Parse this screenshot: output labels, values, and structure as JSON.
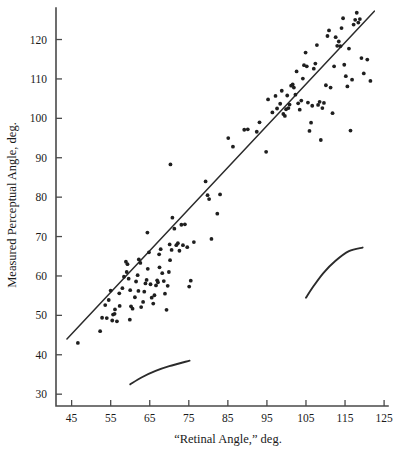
{
  "chart_data": {
    "type": "scatter",
    "title": "",
    "xlabel": "“Retinal Angle,” deg.",
    "ylabel": "Measured Perceptual Angle, deg.",
    "xlim": [
      41,
      126
    ],
    "ylim": [
      27,
      128
    ],
    "grid": false,
    "legend": "none",
    "point_color": "#1f1f1f",
    "line_color": "#2b2b2b",
    "xticks": [
      45,
      55,
      65,
      75,
      85,
      95,
      105,
      115,
      125
    ],
    "yticks": [
      30,
      40,
      50,
      60,
      70,
      80,
      90,
      100,
      110,
      120
    ],
    "xtick_labels": [
      "45",
      "55",
      "65",
      "75",
      "85",
      "95",
      "105",
      "115",
      "125"
    ],
    "ytick_labels": [
      "30",
      "40",
      "50",
      "60",
      "70",
      "80",
      "90",
      "100",
      "110",
      "120"
    ],
    "series": [
      {
        "name": "observations",
        "marker": "filled-circle",
        "points": [
          [
            46.6,
            43.0
          ],
          [
            52.3,
            46.0
          ],
          [
            52.8,
            49.4
          ],
          [
            54.0,
            49.3
          ],
          [
            53.6,
            52.6
          ],
          [
            54.5,
            53.9
          ],
          [
            55.0,
            56.3
          ],
          [
            55.6,
            50.2
          ],
          [
            56.0,
            50.4
          ],
          [
            56.1,
            51.5
          ],
          [
            55.4,
            48.7
          ],
          [
            56.6,
            48.5
          ],
          [
            57.3,
            52.4
          ],
          [
            57.2,
            55.6
          ],
          [
            58.0,
            56.9
          ],
          [
            58.4,
            59.8
          ],
          [
            58.9,
            63.6
          ],
          [
            59.3,
            63.0
          ],
          [
            59.1,
            61.0
          ],
          [
            59.6,
            59.3
          ],
          [
            60.0,
            56.4
          ],
          [
            60.2,
            52.3
          ],
          [
            59.9,
            48.9
          ],
          [
            60.6,
            51.7
          ],
          [
            61.2,
            54.6
          ],
          [
            61.5,
            58.6
          ],
          [
            61.9,
            60.2
          ],
          [
            62.2,
            64.2
          ],
          [
            62.6,
            63.3
          ],
          [
            62.1,
            56.2
          ],
          [
            62.8,
            52.1
          ],
          [
            63.3,
            53.4
          ],
          [
            63.6,
            56.0
          ],
          [
            63.9,
            58.1
          ],
          [
            64.2,
            59.0
          ],
          [
            64.5,
            61.8
          ],
          [
            64.8,
            66.0
          ],
          [
            64.4,
            71.0
          ],
          [
            65.2,
            57.9
          ],
          [
            65.5,
            54.5
          ],
          [
            65.9,
            53.0
          ],
          [
            66.2,
            55.1
          ],
          [
            66.6,
            57.6
          ],
          [
            66.9,
            58.9
          ],
          [
            67.1,
            58.4
          ],
          [
            67.5,
            62.2
          ],
          [
            67.8,
            66.8
          ],
          [
            67.4,
            65.5
          ],
          [
            68.2,
            60.7
          ],
          [
            68.6,
            58.7
          ],
          [
            68.9,
            55.5
          ],
          [
            69.3,
            51.4
          ],
          [
            69.6,
            57.5
          ],
          [
            69.9,
            61.0
          ],
          [
            70.2,
            64.0
          ],
          [
            70.6,
            66.6
          ],
          [
            70.1,
            68.0
          ],
          [
            70.8,
            74.8
          ],
          [
            70.3,
            88.3
          ],
          [
            71.3,
            72.0
          ],
          [
            71.8,
            67.8
          ],
          [
            72.2,
            68.3
          ],
          [
            72.6,
            66.4
          ],
          [
            73.1,
            73.0
          ],
          [
            73.5,
            67.8
          ],
          [
            74.0,
            73.1
          ],
          [
            74.6,
            67.3
          ],
          [
            75.1,
            57.3
          ],
          [
            75.5,
            58.8
          ],
          [
            76.3,
            68.6
          ],
          [
            79.3,
            84.0
          ],
          [
            79.8,
            80.5
          ],
          [
            80.2,
            79.5
          ],
          [
            80.8,
            69.4
          ],
          [
            82.3,
            75.8
          ],
          [
            83.0,
            80.7
          ],
          [
            85.1,
            95.0
          ],
          [
            86.3,
            92.8
          ],
          [
            89.2,
            97.1
          ],
          [
            90.1,
            97.2
          ],
          [
            92.4,
            96.6
          ],
          [
            93.1,
            99.0
          ],
          [
            94.8,
            91.5
          ],
          [
            95.3,
            104.8
          ],
          [
            96.4,
            101.5
          ],
          [
            97.2,
            105.7
          ],
          [
            97.6,
            102.5
          ],
          [
            98.4,
            103.7
          ],
          [
            98.8,
            107.0
          ],
          [
            99.2,
            101.1
          ],
          [
            99.6,
            100.6
          ],
          [
            99.9,
            102.3
          ],
          [
            100.2,
            105.8
          ],
          [
            100.5,
            102.6
          ],
          [
            100.8,
            103.5
          ],
          [
            101.2,
            108.3
          ],
          [
            101.6,
            108.6
          ],
          [
            101.9,
            107.8
          ],
          [
            102.3,
            106.0
          ],
          [
            102.6,
            111.9
          ],
          [
            103.0,
            103.8
          ],
          [
            103.4,
            102.2
          ],
          [
            103.8,
            104.5
          ],
          [
            104.2,
            110.1
          ],
          [
            104.5,
            113.5
          ],
          [
            104.9,
            116.7
          ],
          [
            105.2,
            113.2
          ],
          [
            105.5,
            104.0
          ],
          [
            105.9,
            96.8
          ],
          [
            106.3,
            98.9
          ],
          [
            106.6,
            103.2
          ],
          [
            107.0,
            112.6
          ],
          [
            107.4,
            113.9
          ],
          [
            107.8,
            118.6
          ],
          [
            108.1,
            103.4
          ],
          [
            108.5,
            104.2
          ],
          [
            108.8,
            94.5
          ],
          [
            109.2,
            102.6
          ],
          [
            109.6,
            103.9
          ],
          [
            110.1,
            108.4
          ],
          [
            110.5,
            120.9
          ],
          [
            110.9,
            122.3
          ],
          [
            111.3,
            107.8
          ],
          [
            111.8,
            101.3
          ],
          [
            112.2,
            113.2
          ],
          [
            112.6,
            120.6
          ],
          [
            113.0,
            118.4
          ],
          [
            113.4,
            119.5
          ],
          [
            113.8,
            118.3
          ],
          [
            114.1,
            122.9
          ],
          [
            114.5,
            125.4
          ],
          [
            114.8,
            113.6
          ],
          [
            115.2,
            110.7
          ],
          [
            115.6,
            108.1
          ],
          [
            116.0,
            117.7
          ],
          [
            116.4,
            96.9
          ],
          [
            116.8,
            109.8
          ],
          [
            117.2,
            123.8
          ],
          [
            117.6,
            125.0
          ],
          [
            118.0,
            126.8
          ],
          [
            118.4,
            124.3
          ],
          [
            118.8,
            125.2
          ],
          [
            119.2,
            115.3
          ],
          [
            119.8,
            111.4
          ],
          [
            120.7,
            114.9
          ],
          [
            121.5,
            109.5
          ]
        ]
      }
    ],
    "fit_line": {
      "name": "regression-line",
      "x": [
        43.8,
        122.5
      ],
      "y": [
        44.0,
        127.2
      ]
    },
    "annotation_curves": [
      {
        "name": "lower-arc",
        "points": [
          [
            60.0,
            32.5
          ],
          [
            63.0,
            34.3
          ],
          [
            66.5,
            35.9
          ],
          [
            70.0,
            37.1
          ],
          [
            75.2,
            38.5
          ]
        ]
      },
      {
        "name": "upper-arc",
        "points": [
          [
            105.0,
            54.5
          ],
          [
            107.0,
            57.5
          ],
          [
            109.5,
            60.8
          ],
          [
            112.5,
            63.8
          ],
          [
            116.0,
            66.3
          ],
          [
            119.5,
            67.2
          ]
        ]
      }
    ]
  }
}
